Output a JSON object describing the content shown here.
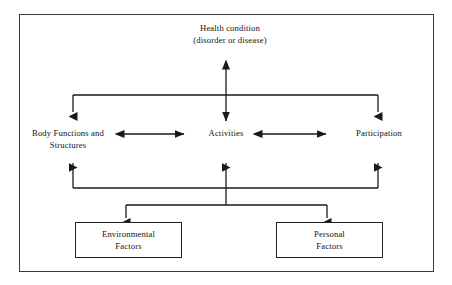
{
  "diagram": {
    "frame": {
      "border_color": "#3a3a3a"
    },
    "line_color": "#1a1a1a",
    "nodes": {
      "health_condition": {
        "line1": "Health  condition",
        "line2": "(disorder or disease)"
      },
      "body_functions": {
        "line1": "Body Functions and",
        "line2": "Structures"
      },
      "activities": {
        "line1": "Activities"
      },
      "participation": {
        "line1": "Participation"
      },
      "environmental_factors": {
        "line1": "Environmental",
        "line2": "Factors"
      },
      "personal_factors": {
        "line1": "Personal",
        "line2": "Factors"
      }
    },
    "connectors": [
      {
        "name": "health-to-middle-bus",
        "type": "double-headed-vertical"
      },
      {
        "name": "bus-to-body-functions",
        "type": "arrow-down"
      },
      {
        "name": "bus-to-activities",
        "type": "arrow-down"
      },
      {
        "name": "bus-to-participation",
        "type": "arrow-down"
      },
      {
        "name": "body-functions-to-activities",
        "type": "double-headed-horizontal"
      },
      {
        "name": "activities-to-participation",
        "type": "double-headed-horizontal"
      },
      {
        "name": "lower-bus-to-body-functions",
        "type": "arrow-up"
      },
      {
        "name": "lower-bus-to-activities",
        "type": "arrow-up"
      },
      {
        "name": "lower-bus-to-participation",
        "type": "arrow-up"
      },
      {
        "name": "bus-to-environmental-factors",
        "type": "arrow-down"
      },
      {
        "name": "bus-to-personal-factors",
        "type": "arrow-down"
      }
    ]
  }
}
